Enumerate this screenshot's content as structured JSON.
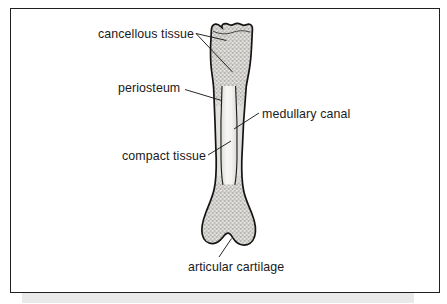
{
  "figure": {
    "frame": {
      "border_color": "#231f20",
      "background_color": "#ffffff",
      "shadow_color": "#e9e9ea"
    },
    "labels": [
      {
        "id": "cancellous",
        "text": "cancellous tissue",
        "anchor": "left",
        "leader_count": 2,
        "target": "spongy bone in proximal epiphysis"
      },
      {
        "id": "periosteum",
        "text": "periosteum",
        "anchor": "left",
        "leader_count": 1,
        "target": "outer membrane of the shaft"
      },
      {
        "id": "medullary",
        "text": "medullary canal",
        "anchor": "right",
        "leader_count": 1,
        "target": "marrow cavity inside the diaphysis"
      },
      {
        "id": "compact",
        "text": "compact tissue",
        "anchor": "left",
        "leader_count": 1,
        "target": "dense cortical wall of the shaft"
      },
      {
        "id": "articular",
        "text": "articular cartilage",
        "anchor": "bottom",
        "leader_count": 1,
        "target": "joint surface of distal end"
      }
    ],
    "bone": {
      "outline_color": "#1b1b1b",
      "cancellous_fill": "#c9c7c4",
      "compact_fill": "#d9d8d5",
      "medullary_fill": "#f2f1ee",
      "orientation": "vertical",
      "regions": [
        "proximal epiphysis",
        "diaphysis",
        "distal epiphysis"
      ]
    }
  }
}
